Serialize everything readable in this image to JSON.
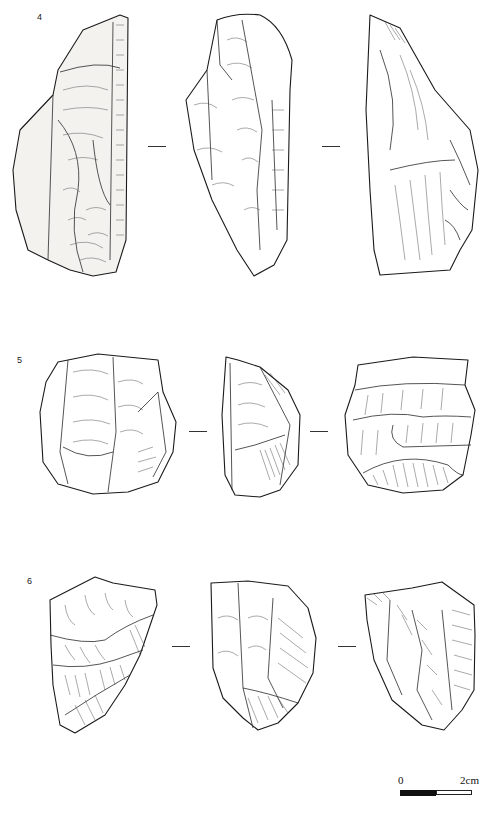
{
  "figure": {
    "artifacts": [
      {
        "number": "4",
        "views": [
          "dorsal",
          "lateral",
          "ventral"
        ],
        "view_separator": "—"
      },
      {
        "number": "5",
        "views": [
          "dorsal",
          "lateral",
          "ventral"
        ],
        "view_separator": "—"
      },
      {
        "number": "6",
        "views": [
          "dorsal",
          "lateral",
          "ventral"
        ],
        "view_separator": "—"
      }
    ],
    "scale_bar": {
      "start_label": "0",
      "end_label": "2cm",
      "segments": 2,
      "colors": [
        "#111111",
        "#ffffff"
      ]
    }
  }
}
